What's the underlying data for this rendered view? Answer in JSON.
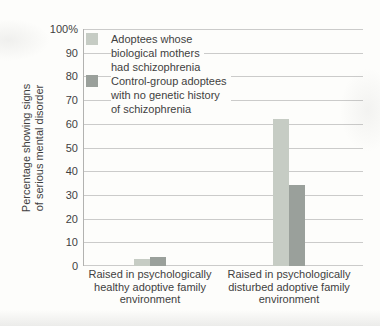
{
  "chart_data": {
    "type": "bar",
    "title": "",
    "ylabel_lines": [
      "Percentage showing signs",
      "of serious mental disorder"
    ],
    "ylim": [
      0,
      100
    ],
    "ytick_values": [
      0,
      10,
      20,
      30,
      40,
      50,
      60,
      70,
      80,
      90,
      100
    ],
    "ytick_labels": [
      "0",
      "10",
      "20",
      "30",
      "40",
      "50",
      "60",
      "70",
      "80",
      "90",
      "100%"
    ],
    "grid": true,
    "legend_position": "inside top-left",
    "categories": [
      [
        "Raised in psychologically",
        "healthy adoptive family",
        "environment"
      ],
      [
        "Raised in psychologically",
        "disturbed adoptive family",
        "environment"
      ]
    ],
    "series": [
      {
        "name_lines": [
          "Adoptees whose",
          "biological mothers",
          "had schizophrenia"
        ],
        "color": "#c6ccc4",
        "values": [
          3,
          62
        ]
      },
      {
        "name_lines": [
          "Control-group adoptees",
          "with no genetic history",
          "of schizophrenia"
        ],
        "color": "#9aa09b",
        "values": [
          4,
          34
        ]
      }
    ]
  },
  "style": {
    "grid_color": "#cbcbca",
    "axis_color": "#b2b2b0",
    "text_color": "#3f3f3f",
    "background": "#fdfdfb"
  }
}
